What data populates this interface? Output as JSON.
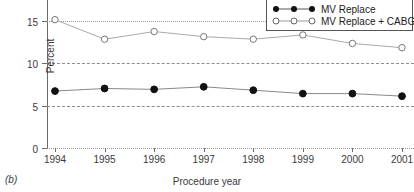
{
  "panel_label": "(b)",
  "legend": {
    "items": [
      {
        "label": "MV Replace",
        "marker": "filled-circle-icon"
      },
      {
        "label": "MV Replace + CABG",
        "marker": "open-circle-icon"
      }
    ]
  },
  "axes": {
    "y_title": "Percent",
    "x_title": "Procedure year",
    "y_ticks": [
      "0",
      "5",
      "10",
      "15",
      "20"
    ],
    "x_ticks": [
      "1994",
      "1995",
      "1996",
      "1997",
      "1998",
      "1999",
      "2000",
      "2001"
    ]
  },
  "colors": {
    "filled_marker": "#111111",
    "open_marker": "#777777",
    "filled_line": "#888888",
    "open_line": "#aaaaaa",
    "grid": "#8d8d8d",
    "axis": "#6b6b6b",
    "text": "#3a3a3a"
  },
  "chart_data": {
    "type": "line",
    "title": "",
    "xlabel": "Procedure year",
    "ylabel": "Percent",
    "categories": [
      "1994",
      "1995",
      "1996",
      "1997",
      "1998",
      "1999",
      "2000",
      "2001"
    ],
    "x": [
      1994,
      1995,
      1996,
      1997,
      1998,
      1999,
      2000,
      2001
    ],
    "ylim": [
      0,
      20
    ],
    "yticks": [
      0,
      5,
      10,
      15,
      20
    ],
    "grid": true,
    "legend_position": "top-right",
    "series": [
      {
        "name": "MV Replace",
        "marker": "filled-circle",
        "values": [
          6.7,
          7.0,
          6.9,
          7.2,
          6.8,
          6.4,
          6.4,
          6.1
        ]
      },
      {
        "name": "MV Replace + CABG",
        "marker": "open-circle",
        "values": [
          15.1,
          12.8,
          13.7,
          13.1,
          12.8,
          13.3,
          12.3,
          11.8
        ]
      }
    ]
  }
}
